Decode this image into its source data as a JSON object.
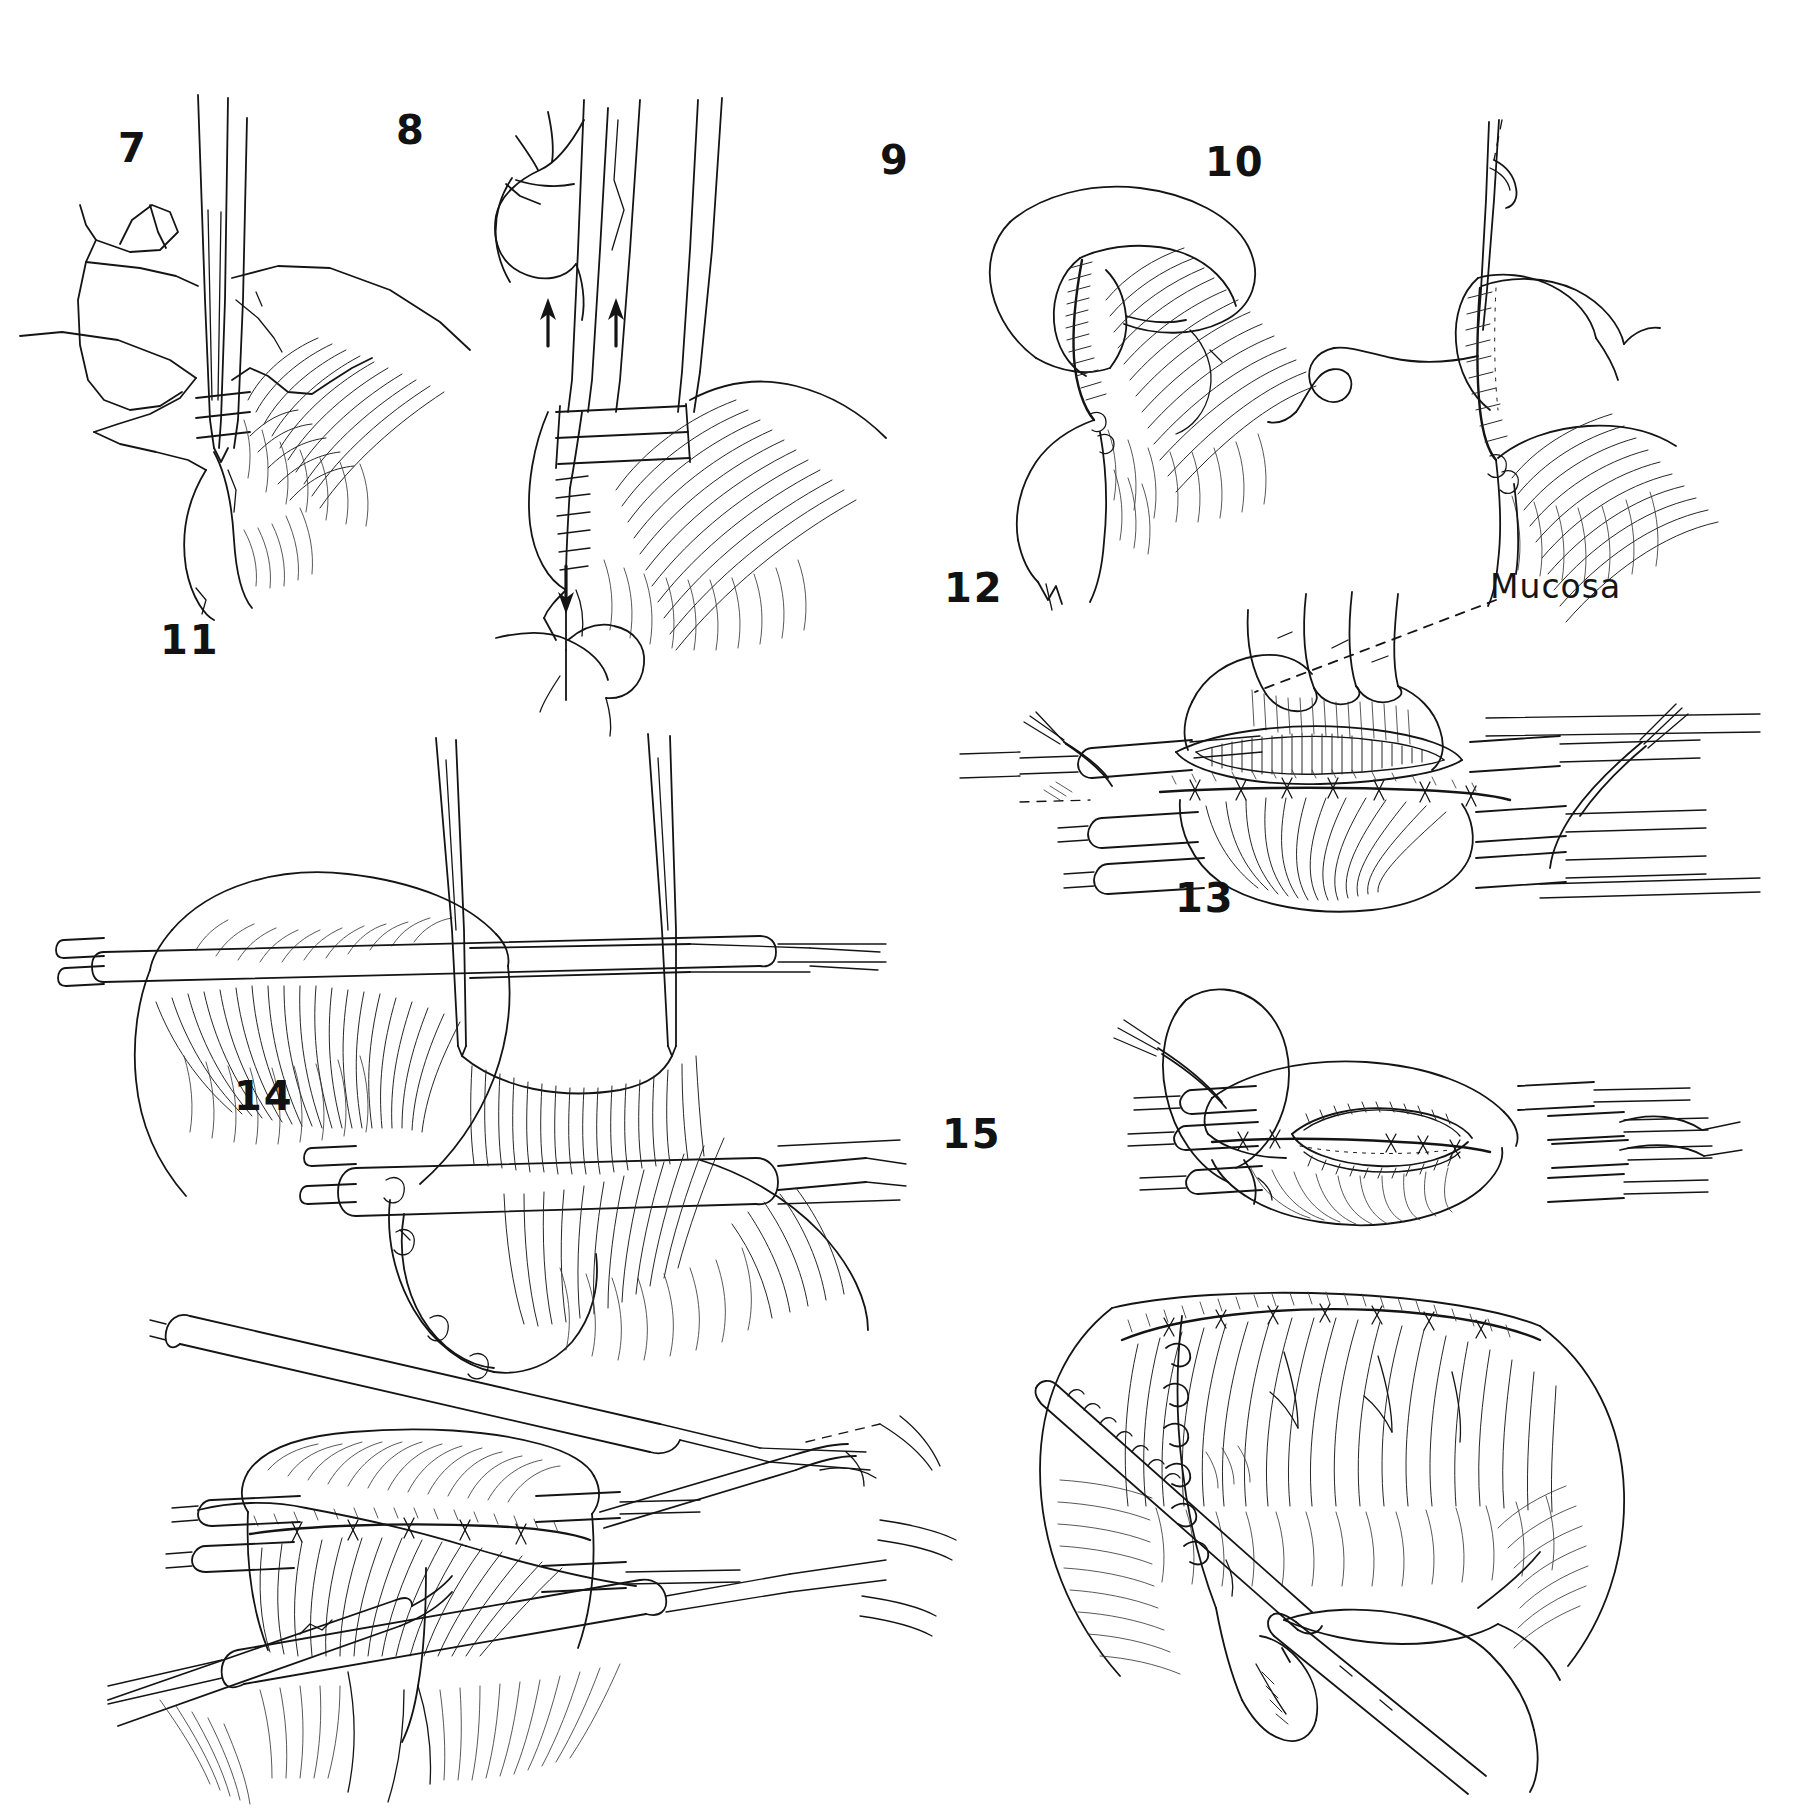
{
  "plate": {
    "title": "Surgical technique illustration plate",
    "background_color": "#ffffff",
    "ink_color": "#141414",
    "width": 1795,
    "height": 1809,
    "style": "pen-and-ink line drawing"
  },
  "figures": [
    {
      "number": "7",
      "label_x": 118,
      "label_y": 128,
      "caption": "",
      "description": "Needle holder grasping curved needle at tissue edge with suture loop to the left"
    },
    {
      "number": "8",
      "label_x": 396,
      "label_y": 110,
      "caption": "",
      "description": "Needle holder withdrawing suture; arrows indicate direction of pull"
    },
    {
      "number": "9",
      "label_x": 880,
      "label_y": 140,
      "caption": "",
      "description": "Tissue flap retracted showing completed suture line"
    },
    {
      "number": "10",
      "label_x": 1205,
      "label_y": 142,
      "caption": "",
      "description": "Running suture being tightened, free suture tail curving left"
    },
    {
      "number": "11",
      "label_x": 160,
      "label_y": 620,
      "caption": "",
      "description": "Wide exposure with tube retractors and two fine forceps elevating tissue"
    },
    {
      "number": "12",
      "label_x": 944,
      "label_y": 568,
      "caption": "",
      "description": "Horizontal exposure with multiple tube retractors, mucosal opening annotated"
    },
    {
      "number": "13",
      "label_x": 1175,
      "label_y": 878,
      "caption": "",
      "description": "Longitudinal incision held open by tube retractors and suture loop"
    },
    {
      "number": "14",
      "label_x": 234,
      "label_y": 1076,
      "caption": "",
      "description": "Completed suture line with tube retractors, forceps and trailing suture"
    },
    {
      "number": "15",
      "label_x": 942,
      "label_y": 1114,
      "caption": "",
      "description": "Final closure with interrupted sutures, scissors and forceps in field"
    }
  ],
  "annotations": [
    {
      "id": "mucosa",
      "text": "Mucosa",
      "label_x": 1490,
      "label_y": 570,
      "leader": {
        "type": "dashed",
        "from_x": 1494,
        "from_y": 598,
        "to_x": 1250,
        "to_y": 690
      },
      "belongs_to_figure": "12"
    }
  ],
  "arrows": [
    {
      "figure": "8",
      "direction": "up",
      "x": 548,
      "y": 300,
      "length": 45
    },
    {
      "figure": "8",
      "direction": "up",
      "x": 613,
      "y": 300,
      "length": 45
    },
    {
      "figure": "8",
      "direction": "down",
      "x": 565,
      "y": 520,
      "length": 40
    }
  ],
  "colors": {
    "ink": "#141414",
    "hatch": "#262626",
    "hatch_light": "#3a3a3a",
    "paper": "#ffffff"
  }
}
